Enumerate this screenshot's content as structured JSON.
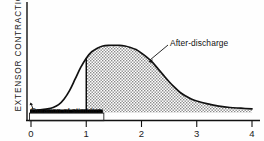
{
  "figure": {
    "y_axis_label": "EXTENSOR CONTRACTION",
    "stimulus_label": "Duration of stimulus",
    "annotation_label": "After-discharge"
  },
  "chart_data": {
    "type": "line",
    "title": "",
    "xlabel": "",
    "ylabel": "EXTENSOR CONTRACTION",
    "xlim": [
      0,
      4
    ],
    "ylim": [
      0,
      1
    ],
    "grid": false,
    "legend": null,
    "xticks": [
      0,
      1,
      2,
      3,
      4
    ],
    "xticklabels": [
      "0",
      "1",
      "2",
      "3",
      "4"
    ],
    "yticks": [],
    "yticklabels": [],
    "annotations": [
      {
        "text": "After-discharge",
        "x": 2.55,
        "y": 0.78,
        "arrow_to_x": 2.05,
        "arrow_to_y": 0.52,
        "description": "label with leader line pointing to stippled region"
      },
      {
        "text": "Duration of stimulus",
        "x": 0.05,
        "y": 0.02,
        "description": "label inside box under the black stimulus bar"
      }
    ],
    "stimulus_bar": {
      "label": "Duration of stimulus",
      "x_start": 0.0,
      "x_end": 1.3,
      "color": "#000000"
    },
    "shaded_region": {
      "name": "after-discharge",
      "x_start": 1.0,
      "x_end": 4.0,
      "fill": "stipple",
      "fill_color": "#8c8c8c",
      "boundary_line_x": 1.0
    },
    "series": [
      {
        "name": "extensor contraction",
        "color": "#000000",
        "x": [
          0.0,
          0.1,
          0.2,
          0.3,
          0.4,
          0.5,
          0.6,
          0.7,
          0.8,
          0.9,
          1.0,
          1.1,
          1.2,
          1.3,
          1.4,
          1.5,
          1.6,
          1.7,
          1.8,
          1.9,
          2.0,
          2.1,
          2.2,
          2.3,
          2.4,
          2.5,
          2.6,
          2.7,
          2.8,
          2.9,
          3.0,
          3.2,
          3.4,
          3.6,
          3.8,
          4.0
        ],
        "y": [
          0.03,
          0.03,
          0.04,
          0.05,
          0.07,
          0.11,
          0.19,
          0.31,
          0.47,
          0.63,
          0.76,
          0.85,
          0.9,
          0.93,
          0.94,
          0.94,
          0.94,
          0.93,
          0.91,
          0.88,
          0.83,
          0.77,
          0.7,
          0.61,
          0.52,
          0.43,
          0.35,
          0.28,
          0.23,
          0.19,
          0.16,
          0.12,
          0.09,
          0.07,
          0.06,
          0.05
        ]
      }
    ]
  }
}
